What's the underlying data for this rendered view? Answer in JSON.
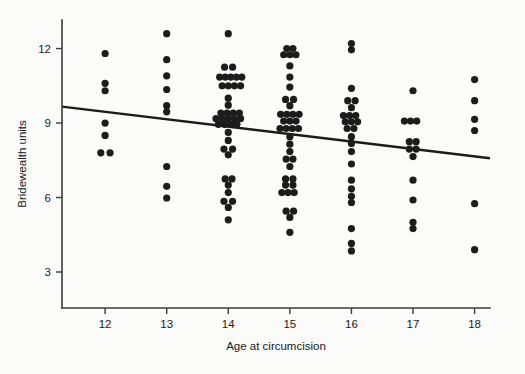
{
  "chart_data": {
    "type": "scatter",
    "title": "",
    "xlabel": "Age at circumcision",
    "ylabel": "Bridewealth units",
    "xlim": [
      11.3,
      18.25
    ],
    "ylim": [
      1.55,
      13.15
    ],
    "xticks": [
      12,
      13,
      14,
      15,
      16,
      17,
      18
    ],
    "xtick_labels": [
      "12",
      "13",
      "14",
      "15",
      "16",
      "17",
      "18"
    ],
    "yticks": [
      3,
      6,
      9,
      12
    ],
    "ytick_labels": [
      "3",
      "6",
      "9",
      "12"
    ],
    "grid": false,
    "legend": false,
    "marker": {
      "shape": "circle",
      "size_px": 7.2,
      "color": "#1c1c1c"
    },
    "fit_line": {
      "label": "linear regression",
      "color": "#1c1c1c",
      "width_px": 2.4,
      "x_start": 11.3,
      "y_start": 9.66,
      "x_end": 18.25,
      "y_end": 7.58,
      "slope": -0.3,
      "intercept": 13.05
    },
    "series": [
      {
        "name": "observations",
        "points": [
          {
            "x": 12,
            "y": 11.8
          },
          {
            "x": 12,
            "y": 10.6
          },
          {
            "x": 12,
            "y": 10.3
          },
          {
            "x": 12,
            "y": 9.0
          },
          {
            "x": 12,
            "y": 8.5
          },
          {
            "x": 11.93,
            "y": 7.8
          },
          {
            "x": 12.08,
            "y": 7.8
          },
          {
            "x": 13,
            "y": 12.6
          },
          {
            "x": 13,
            "y": 11.55
          },
          {
            "x": 13,
            "y": 10.9
          },
          {
            "x": 13,
            "y": 10.35
          },
          {
            "x": 13,
            "y": 9.7
          },
          {
            "x": 13,
            "y": 9.45
          },
          {
            "x": 13,
            "y": 7.25
          },
          {
            "x": 13,
            "y": 6.45
          },
          {
            "x": 13,
            "y": 5.98
          },
          {
            "x": 14,
            "y": 12.6
          },
          {
            "x": 13.94,
            "y": 11.25
          },
          {
            "x": 14.07,
            "y": 11.25
          },
          {
            "x": 13.86,
            "y": 10.85
          },
          {
            "x": 13.95,
            "y": 10.85
          },
          {
            "x": 14.04,
            "y": 10.85
          },
          {
            "x": 14.13,
            "y": 10.85
          },
          {
            "x": 14.22,
            "y": 10.85
          },
          {
            "x": 13.9,
            "y": 10.5
          },
          {
            "x": 14.0,
            "y": 10.5
          },
          {
            "x": 14.1,
            "y": 10.5
          },
          {
            "x": 14.2,
            "y": 10.5
          },
          {
            "x": 14.0,
            "y": 10.0
          },
          {
            "x": 14.0,
            "y": 9.72
          },
          {
            "x": 13.88,
            "y": 9.4
          },
          {
            "x": 13.98,
            "y": 9.4
          },
          {
            "x": 14.08,
            "y": 9.4
          },
          {
            "x": 14.18,
            "y": 9.4
          },
          {
            "x": 13.8,
            "y": 9.18
          },
          {
            "x": 13.9,
            "y": 9.18
          },
          {
            "x": 14.0,
            "y": 9.18
          },
          {
            "x": 14.1,
            "y": 9.18
          },
          {
            "x": 14.2,
            "y": 9.18
          },
          {
            "x": 13.84,
            "y": 8.95
          },
          {
            "x": 13.94,
            "y": 8.95
          },
          {
            "x": 14.04,
            "y": 8.95
          },
          {
            "x": 14.14,
            "y": 8.95
          },
          {
            "x": 14.0,
            "y": 8.62
          },
          {
            "x": 14.0,
            "y": 8.3
          },
          {
            "x": 13.93,
            "y": 7.95
          },
          {
            "x": 14.07,
            "y": 7.95
          },
          {
            "x": 14.0,
            "y": 7.72
          },
          {
            "x": 13.95,
            "y": 6.75
          },
          {
            "x": 14.06,
            "y": 6.75
          },
          {
            "x": 14.0,
            "y": 6.5
          },
          {
            "x": 14.0,
            "y": 6.2
          },
          {
            "x": 13.93,
            "y": 5.85
          },
          {
            "x": 14.07,
            "y": 5.85
          },
          {
            "x": 14.0,
            "y": 5.6
          },
          {
            "x": 14.0,
            "y": 5.1
          },
          {
            "x": 14.95,
            "y": 12.0
          },
          {
            "x": 15.05,
            "y": 12.0
          },
          {
            "x": 14.9,
            "y": 11.75
          },
          {
            "x": 15.0,
            "y": 11.75
          },
          {
            "x": 15.1,
            "y": 11.75
          },
          {
            "x": 15.0,
            "y": 11.3
          },
          {
            "x": 15.0,
            "y": 10.85
          },
          {
            "x": 15.0,
            "y": 10.45
          },
          {
            "x": 14.93,
            "y": 9.95
          },
          {
            "x": 15.06,
            "y": 9.95
          },
          {
            "x": 15.0,
            "y": 9.7
          },
          {
            "x": 14.85,
            "y": 9.35
          },
          {
            "x": 14.95,
            "y": 9.35
          },
          {
            "x": 15.05,
            "y": 9.35
          },
          {
            "x": 15.15,
            "y": 9.35
          },
          {
            "x": 14.9,
            "y": 9.08
          },
          {
            "x": 15.0,
            "y": 9.08
          },
          {
            "x": 15.1,
            "y": 9.08
          },
          {
            "x": 14.84,
            "y": 8.78
          },
          {
            "x": 14.94,
            "y": 8.78
          },
          {
            "x": 15.04,
            "y": 8.78
          },
          {
            "x": 15.14,
            "y": 8.78
          },
          {
            "x": 15.0,
            "y": 8.45
          },
          {
            "x": 15.0,
            "y": 8.15
          },
          {
            "x": 15.0,
            "y": 7.85
          },
          {
            "x": 14.94,
            "y": 7.55
          },
          {
            "x": 15.05,
            "y": 7.55
          },
          {
            "x": 15.0,
            "y": 7.25
          },
          {
            "x": 14.93,
            "y": 6.75
          },
          {
            "x": 15.05,
            "y": 6.75
          },
          {
            "x": 14.93,
            "y": 6.5
          },
          {
            "x": 15.05,
            "y": 6.5
          },
          {
            "x": 14.87,
            "y": 6.2
          },
          {
            "x": 14.97,
            "y": 6.2
          },
          {
            "x": 15.07,
            "y": 6.2
          },
          {
            "x": 14.94,
            "y": 5.45
          },
          {
            "x": 15.06,
            "y": 5.45
          },
          {
            "x": 15.0,
            "y": 5.2
          },
          {
            "x": 15.0,
            "y": 4.6
          },
          {
            "x": 16.0,
            "y": 12.2
          },
          {
            "x": 16.0,
            "y": 11.95
          },
          {
            "x": 16.0,
            "y": 10.4
          },
          {
            "x": 15.94,
            "y": 9.9
          },
          {
            "x": 16.06,
            "y": 9.9
          },
          {
            "x": 16.0,
            "y": 9.62
          },
          {
            "x": 15.87,
            "y": 9.3
          },
          {
            "x": 15.97,
            "y": 9.3
          },
          {
            "x": 16.07,
            "y": 9.3
          },
          {
            "x": 15.9,
            "y": 9.05
          },
          {
            "x": 16.0,
            "y": 9.05
          },
          {
            "x": 16.1,
            "y": 9.05
          },
          {
            "x": 15.93,
            "y": 8.78
          },
          {
            "x": 16.04,
            "y": 8.78
          },
          {
            "x": 16.0,
            "y": 8.45
          },
          {
            "x": 16.0,
            "y": 8.18
          },
          {
            "x": 16.0,
            "y": 7.85
          },
          {
            "x": 16.0,
            "y": 7.35
          },
          {
            "x": 16.0,
            "y": 6.7
          },
          {
            "x": 16.0,
            "y": 6.35
          },
          {
            "x": 16.0,
            "y": 6.05
          },
          {
            "x": 16.0,
            "y": 5.8
          },
          {
            "x": 16.0,
            "y": 4.75
          },
          {
            "x": 16.0,
            "y": 4.15
          },
          {
            "x": 16.0,
            "y": 3.85
          },
          {
            "x": 17.0,
            "y": 10.3
          },
          {
            "x": 16.86,
            "y": 9.08
          },
          {
            "x": 16.96,
            "y": 9.08
          },
          {
            "x": 17.06,
            "y": 9.08
          },
          {
            "x": 16.94,
            "y": 8.25
          },
          {
            "x": 17.05,
            "y": 8.25
          },
          {
            "x": 16.94,
            "y": 7.95
          },
          {
            "x": 17.05,
            "y": 7.95
          },
          {
            "x": 17.0,
            "y": 7.65
          },
          {
            "x": 17.0,
            "y": 6.7
          },
          {
            "x": 17.0,
            "y": 5.9
          },
          {
            "x": 17.0,
            "y": 5.0
          },
          {
            "x": 17.0,
            "y": 4.75
          },
          {
            "x": 18,
            "y": 10.75
          },
          {
            "x": 18,
            "y": 9.9
          },
          {
            "x": 18,
            "y": 9.15
          },
          {
            "x": 18,
            "y": 8.7
          },
          {
            "x": 18,
            "y": 5.75
          },
          {
            "x": 18,
            "y": 3.9
          }
        ]
      }
    ]
  }
}
